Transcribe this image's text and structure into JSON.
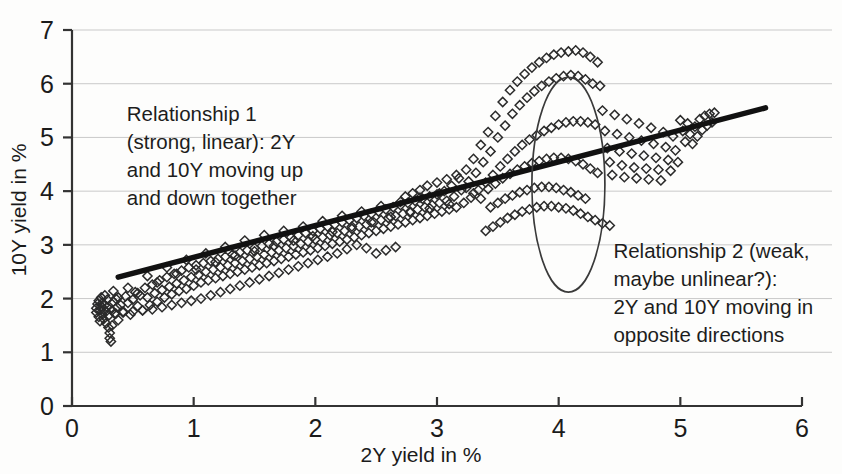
{
  "chart_data": {
    "type": "scatter",
    "title": "",
    "xlabel": "2Y yield in %",
    "ylabel": "10Y yield in %",
    "xlim": [
      0,
      6
    ],
    "ylim": [
      0,
      7
    ],
    "xticks": [
      "0",
      "1",
      "2",
      "3",
      "4",
      "5",
      "6"
    ],
    "yticks": [
      "0",
      "1",
      "2",
      "3",
      "4",
      "5",
      "6",
      "7"
    ],
    "grid": "horizontal",
    "legend": "none",
    "marker": "open-diamond",
    "marker_color": "#2b2b2b",
    "trendline": {
      "label": "linear trend",
      "color": "#111111",
      "x_start": 0.38,
      "y_start": 2.4,
      "x_end": 5.7,
      "y_end": 5.55
    },
    "highlight_ellipse": {
      "label": "relationship-2-cluster",
      "center_x": 4.08,
      "center_y": 4.12,
      "radius_x": 0.3,
      "radius_y": 2.0,
      "color": "#3a3a3a"
    },
    "annotations": [
      {
        "name": "relationship-1",
        "x": 0.45,
        "y": 5.3,
        "lines": [
          "Relationship 1",
          "(strong, linear): 2Y",
          "and 10Y moving up",
          "and down together"
        ]
      },
      {
        "name": "relationship-2",
        "x": 4.45,
        "y": 2.75,
        "lines": [
          "Relationship 2 (weak,",
          "maybe unlinear?):",
          "2Y and 10Y moving in",
          "opposite directions"
        ]
      }
    ],
    "points": [
      [
        0.2,
        1.82
      ],
      [
        0.2,
        1.74
      ],
      [
        0.21,
        1.9
      ],
      [
        0.22,
        1.66
      ],
      [
        0.22,
        1.96
      ],
      [
        0.23,
        1.78
      ],
      [
        0.23,
        1.58
      ],
      [
        0.24,
        1.86
      ],
      [
        0.24,
        2.02
      ],
      [
        0.25,
        1.7
      ],
      [
        0.25,
        1.92
      ],
      [
        0.26,
        1.8
      ],
      [
        0.26,
        1.62
      ],
      [
        0.27,
        1.88
      ],
      [
        0.27,
        2.06
      ],
      [
        0.28,
        1.76
      ],
      [
        0.28,
        1.54
      ],
      [
        0.29,
        1.84
      ],
      [
        0.29,
        1.98
      ],
      [
        0.3,
        1.68
      ],
      [
        0.3,
        1.46
      ],
      [
        0.31,
        1.36
      ],
      [
        0.31,
        1.26
      ],
      [
        0.32,
        1.2
      ],
      [
        0.33,
        1.5
      ],
      [
        0.33,
        1.78
      ],
      [
        0.34,
        1.94
      ],
      [
        0.35,
        1.72
      ],
      [
        0.36,
        2.0
      ],
      [
        0.37,
        1.84
      ],
      [
        0.38,
        1.6
      ],
      [
        0.4,
        1.88
      ],
      [
        0.42,
        1.76
      ],
      [
        0.44,
        2.04
      ],
      [
        0.46,
        1.92
      ],
      [
        0.48,
        1.7
      ],
      [
        0.5,
        1.98
      ],
      [
        0.52,
        2.12
      ],
      [
        0.54,
        1.86
      ],
      [
        0.56,
        2.06
      ],
      [
        0.58,
        1.78
      ],
      [
        0.6,
        2.2
      ],
      [
        0.62,
        2.02
      ],
      [
        0.64,
        1.88
      ],
      [
        0.66,
        2.26
      ],
      [
        0.68,
        2.1
      ],
      [
        0.7,
        1.94
      ],
      [
        0.72,
        2.34
      ],
      [
        0.74,
        2.16
      ],
      [
        0.76,
        2.02
      ],
      [
        0.78,
        2.4
      ],
      [
        0.8,
        2.22
      ],
      [
        0.82,
        2.08
      ],
      [
        0.84,
        2.46
      ],
      [
        0.86,
        2.28
      ],
      [
        0.88,
        2.14
      ],
      [
        0.9,
        2.52
      ],
      [
        0.92,
        2.34
      ],
      [
        0.94,
        2.18
      ],
      [
        0.96,
        2.58
      ],
      [
        0.98,
        2.4
      ],
      [
        1.0,
        2.24
      ],
      [
        1.02,
        2.62
      ],
      [
        1.04,
        2.44
      ],
      [
        1.06,
        2.3
      ],
      [
        1.08,
        2.66
      ],
      [
        1.1,
        2.5
      ],
      [
        1.12,
        2.34
      ],
      [
        1.14,
        2.7
      ],
      [
        1.16,
        2.54
      ],
      [
        1.18,
        2.38
      ],
      [
        1.2,
        2.74
      ],
      [
        1.22,
        2.58
      ],
      [
        1.24,
        2.42
      ],
      [
        1.26,
        2.78
      ],
      [
        1.28,
        2.62
      ],
      [
        1.3,
        2.46
      ],
      [
        1.32,
        2.82
      ],
      [
        1.34,
        2.66
      ],
      [
        1.36,
        2.5
      ],
      [
        1.38,
        2.86
      ],
      [
        1.4,
        2.7
      ],
      [
        1.42,
        2.54
      ],
      [
        1.44,
        2.9
      ],
      [
        1.46,
        2.74
      ],
      [
        1.48,
        2.58
      ],
      [
        1.5,
        2.94
      ],
      [
        1.52,
        2.78
      ],
      [
        1.54,
        2.62
      ],
      [
        1.56,
        2.98
      ],
      [
        1.58,
        2.82
      ],
      [
        1.6,
        2.66
      ],
      [
        1.62,
        3.02
      ],
      [
        1.64,
        2.86
      ],
      [
        1.66,
        2.7
      ],
      [
        1.68,
        3.06
      ],
      [
        1.7,
        2.9
      ],
      [
        1.72,
        2.74
      ],
      [
        1.74,
        3.1
      ],
      [
        1.76,
        2.94
      ],
      [
        1.78,
        2.78
      ],
      [
        1.8,
        3.14
      ],
      [
        1.82,
        2.98
      ],
      [
        1.84,
        2.82
      ],
      [
        1.86,
        3.18
      ],
      [
        1.88,
        3.02
      ],
      [
        1.9,
        2.86
      ],
      [
        1.92,
        3.22
      ],
      [
        1.94,
        3.06
      ],
      [
        1.96,
        2.9
      ],
      [
        1.98,
        3.26
      ],
      [
        2.0,
        3.1
      ],
      [
        2.02,
        2.94
      ],
      [
        2.04,
        3.3
      ],
      [
        2.06,
        3.14
      ],
      [
        2.08,
        2.98
      ],
      [
        2.1,
        3.34
      ],
      [
        2.12,
        3.18
      ],
      [
        2.14,
        3.02
      ],
      [
        2.16,
        3.38
      ],
      [
        2.18,
        3.22
      ],
      [
        2.2,
        3.06
      ],
      [
        2.22,
        3.42
      ],
      [
        2.24,
        3.26
      ],
      [
        2.26,
        3.1
      ],
      [
        2.28,
        3.46
      ],
      [
        2.3,
        3.3
      ],
      [
        2.32,
        3.14
      ],
      [
        2.34,
        3.5
      ],
      [
        2.36,
        3.34
      ],
      [
        2.38,
        3.18
      ],
      [
        2.4,
        3.54
      ],
      [
        2.42,
        3.38
      ],
      [
        2.44,
        3.22
      ],
      [
        2.46,
        3.58
      ],
      [
        2.48,
        3.42
      ],
      [
        2.5,
        3.26
      ],
      [
        2.52,
        3.62
      ],
      [
        2.54,
        3.46
      ],
      [
        2.56,
        3.3
      ],
      [
        2.58,
        3.66
      ],
      [
        2.6,
        3.5
      ],
      [
        2.62,
        3.34
      ],
      [
        2.64,
        3.7
      ],
      [
        2.66,
        3.54
      ],
      [
        2.68,
        3.38
      ],
      [
        2.7,
        3.74
      ],
      [
        2.72,
        3.58
      ],
      [
        2.74,
        3.42
      ],
      [
        2.76,
        3.78
      ],
      [
        2.78,
        3.62
      ],
      [
        2.8,
        3.46
      ],
      [
        2.82,
        3.82
      ],
      [
        2.84,
        3.66
      ],
      [
        2.86,
        3.5
      ],
      [
        2.88,
        3.86
      ],
      [
        2.9,
        3.7
      ],
      [
        2.92,
        3.54
      ],
      [
        2.94,
        3.9
      ],
      [
        2.96,
        3.74
      ],
      [
        2.98,
        3.58
      ],
      [
        3.0,
        3.94
      ],
      [
        3.02,
        3.78
      ],
      [
        3.04,
        3.62
      ],
      [
        3.06,
        4.0
      ],
      [
        3.08,
        3.82
      ],
      [
        3.1,
        3.66
      ],
      [
        3.12,
        4.1
      ],
      [
        3.14,
        3.9
      ],
      [
        3.16,
        3.7
      ],
      [
        3.18,
        4.24
      ],
      [
        3.2,
        4.02
      ],
      [
        3.22,
        3.78
      ],
      [
        3.24,
        4.4
      ],
      [
        3.26,
        4.18
      ],
      [
        3.28,
        3.88
      ],
      [
        3.3,
        4.6
      ],
      [
        3.32,
        4.34
      ],
      [
        3.34,
        4.02
      ],
      [
        3.36,
        4.86
      ],
      [
        3.38,
        4.54
      ],
      [
        3.4,
        4.16
      ],
      [
        3.42,
        5.1
      ],
      [
        3.44,
        4.74
      ],
      [
        3.46,
        4.3
      ],
      [
        3.48,
        5.4
      ],
      [
        3.5,
        5.0
      ],
      [
        3.52,
        4.46
      ],
      [
        3.54,
        5.66
      ],
      [
        3.56,
        5.22
      ],
      [
        3.58,
        4.6
      ],
      [
        3.6,
        5.88
      ],
      [
        3.62,
        5.44
      ],
      [
        3.64,
        4.74
      ],
      [
        3.66,
        6.04
      ],
      [
        3.68,
        5.6
      ],
      [
        3.7,
        4.86
      ],
      [
        3.72,
        6.18
      ],
      [
        3.74,
        5.74
      ],
      [
        3.76,
        4.96
      ],
      [
        3.78,
        6.3
      ],
      [
        3.8,
        5.86
      ],
      [
        3.82,
        5.04
      ],
      [
        3.84,
        6.4
      ],
      [
        3.86,
        5.96
      ],
      [
        3.88,
        5.12
      ],
      [
        3.9,
        6.48
      ],
      [
        3.92,
        6.04
      ],
      [
        3.94,
        5.18
      ],
      [
        3.96,
        6.54
      ],
      [
        3.98,
        6.1
      ],
      [
        4.0,
        5.24
      ],
      [
        4.02,
        6.58
      ],
      [
        4.04,
        6.14
      ],
      [
        4.06,
        5.28
      ],
      [
        4.08,
        6.6
      ],
      [
        4.1,
        6.16
      ],
      [
        4.12,
        5.3
      ],
      [
        4.14,
        6.62
      ],
      [
        4.16,
        6.14
      ],
      [
        4.18,
        5.3
      ],
      [
        4.2,
        6.58
      ],
      [
        4.22,
        6.08
      ],
      [
        4.24,
        5.28
      ],
      [
        4.26,
        6.5
      ],
      [
        4.28,
        6.0
      ],
      [
        4.3,
        5.24
      ],
      [
        4.32,
        6.4
      ],
      [
        3.42,
        4.04
      ],
      [
        3.48,
        4.14
      ],
      [
        3.54,
        4.24
      ],
      [
        3.6,
        4.32
      ],
      [
        3.66,
        4.4
      ],
      [
        3.72,
        4.46
      ],
      [
        3.78,
        4.52
      ],
      [
        3.84,
        4.56
      ],
      [
        3.9,
        4.6
      ],
      [
        3.96,
        4.62
      ],
      [
        4.02,
        4.62
      ],
      [
        4.08,
        4.6
      ],
      [
        4.14,
        4.56
      ],
      [
        4.2,
        4.5
      ],
      [
        4.26,
        4.42
      ],
      [
        4.32,
        4.34
      ],
      [
        3.44,
        3.7
      ],
      [
        3.5,
        3.78
      ],
      [
        3.56,
        3.86
      ],
      [
        3.62,
        3.92
      ],
      [
        3.68,
        3.98
      ],
      [
        3.74,
        4.02
      ],
      [
        3.8,
        4.06
      ],
      [
        3.86,
        4.08
      ],
      [
        3.92,
        4.08
      ],
      [
        3.98,
        4.06
      ],
      [
        4.04,
        4.02
      ],
      [
        4.1,
        3.98
      ],
      [
        4.16,
        3.92
      ],
      [
        4.22,
        3.86
      ],
      [
        3.4,
        3.26
      ],
      [
        3.46,
        3.34
      ],
      [
        3.52,
        3.42
      ],
      [
        3.58,
        3.5
      ],
      [
        3.64,
        3.56
      ],
      [
        3.7,
        3.62
      ],
      [
        3.76,
        3.66
      ],
      [
        3.82,
        3.7
      ],
      [
        3.88,
        3.72
      ],
      [
        3.94,
        3.72
      ],
      [
        4.0,
        3.7
      ],
      [
        4.06,
        3.68
      ],
      [
        4.12,
        3.64
      ],
      [
        4.18,
        3.58
      ],
      [
        4.24,
        3.52
      ],
      [
        4.3,
        3.46
      ],
      [
        4.36,
        3.4
      ],
      [
        4.42,
        3.36
      ],
      [
        4.34,
        5.96
      ],
      [
        4.36,
        5.5
      ],
      [
        4.38,
        5.12
      ],
      [
        4.4,
        4.8
      ],
      [
        4.42,
        4.54
      ],
      [
        4.44,
        4.3
      ],
      [
        4.46,
        5.42
      ],
      [
        4.48,
        5.06
      ],
      [
        4.5,
        4.74
      ],
      [
        4.52,
        4.48
      ],
      [
        4.54,
        4.26
      ],
      [
        4.56,
        5.34
      ],
      [
        4.58,
        5.0
      ],
      [
        4.6,
        4.7
      ],
      [
        4.62,
        4.44
      ],
      [
        4.64,
        4.24
      ],
      [
        4.66,
        5.26
      ],
      [
        4.68,
        4.94
      ],
      [
        4.7,
        4.66
      ],
      [
        4.72,
        4.42
      ],
      [
        4.74,
        4.22
      ],
      [
        4.76,
        5.18
      ],
      [
        4.78,
        4.88
      ],
      [
        4.8,
        4.62
      ],
      [
        4.82,
        4.4
      ],
      [
        4.84,
        4.2
      ],
      [
        4.86,
        5.1
      ],
      [
        4.88,
        4.82
      ],
      [
        4.9,
        4.58
      ],
      [
        4.92,
        4.38
      ],
      [
        4.94,
        5.02
      ],
      [
        4.96,
        4.76
      ],
      [
        4.98,
        4.54
      ],
      [
        5.0,
        5.32
      ],
      [
        5.02,
        5.12
      ],
      [
        5.04,
        4.92
      ],
      [
        5.06,
        5.26
      ],
      [
        5.08,
        5.06
      ],
      [
        5.1,
        4.88
      ],
      [
        5.12,
        5.2
      ],
      [
        5.14,
        5.02
      ],
      [
        5.16,
        5.34
      ],
      [
        5.18,
        5.14
      ],
      [
        5.2,
        5.4
      ],
      [
        5.22,
        5.22
      ],
      [
        5.24,
        5.44
      ],
      [
        5.26,
        5.28
      ],
      [
        5.28,
        5.46
      ],
      [
        0.62,
        2.42
      ],
      [
        0.7,
        2.3
      ],
      [
        0.78,
        2.58
      ],
      [
        0.86,
        2.46
      ],
      [
        0.94,
        2.72
      ],
      [
        1.02,
        2.54
      ],
      [
        1.1,
        2.84
      ],
      [
        1.18,
        2.68
      ],
      [
        1.26,
        2.96
      ],
      [
        1.34,
        2.8
      ],
      [
        1.42,
        3.08
      ],
      [
        1.5,
        2.88
      ],
      [
        1.58,
        3.18
      ],
      [
        1.66,
        2.98
      ],
      [
        1.74,
        3.26
      ],
      [
        1.82,
        3.08
      ],
      [
        1.9,
        3.34
      ],
      [
        1.98,
        3.16
      ],
      [
        2.06,
        3.44
      ],
      [
        2.14,
        3.24
      ],
      [
        2.22,
        3.54
      ],
      [
        2.3,
        3.34
      ],
      [
        2.38,
        3.62
      ],
      [
        2.46,
        3.42
      ],
      [
        2.54,
        3.72
      ],
      [
        2.62,
        3.52
      ],
      [
        2.7,
        3.8
      ],
      [
        2.78,
        3.6
      ],
      [
        2.86,
        3.88
      ],
      [
        2.94,
        3.68
      ],
      [
        3.02,
        3.96
      ],
      [
        3.1,
        3.76
      ],
      [
        0.46,
        2.2
      ],
      [
        0.54,
        2.1
      ],
      [
        0.38,
        2.02
      ],
      [
        0.34,
        2.14
      ],
      [
        2.92,
        4.1
      ],
      [
        3.0,
        4.16
      ],
      [
        3.08,
        4.22
      ],
      [
        2.86,
        4.02
      ],
      [
        2.8,
        3.96
      ],
      [
        2.74,
        3.9
      ],
      [
        3.16,
        4.3
      ],
      [
        3.24,
        4.06
      ],
      [
        3.3,
        3.96
      ],
      [
        3.36,
        3.86
      ],
      [
        2.66,
        2.96
      ],
      [
        2.58,
        2.9
      ],
      [
        2.5,
        2.84
      ],
      [
        2.42,
        2.94
      ],
      [
        2.34,
        3.0
      ],
      [
        2.26,
        2.92
      ],
      [
        2.18,
        2.84
      ],
      [
        2.1,
        2.78
      ],
      [
        2.02,
        2.72
      ],
      [
        1.94,
        2.66
      ],
      [
        1.86,
        2.6
      ],
      [
        1.78,
        2.54
      ],
      [
        1.7,
        2.48
      ],
      [
        1.62,
        2.42
      ],
      [
        1.54,
        2.36
      ],
      [
        1.46,
        2.3
      ],
      [
        1.38,
        2.24
      ],
      [
        1.3,
        2.18
      ],
      [
        1.22,
        2.12
      ],
      [
        1.14,
        2.06
      ],
      [
        1.06,
        2.0
      ],
      [
        0.98,
        1.96
      ],
      [
        0.9,
        1.92
      ],
      [
        0.82,
        1.88
      ],
      [
        0.74,
        1.84
      ],
      [
        0.66,
        1.8
      ],
      [
        0.58,
        1.78
      ],
      [
        0.5,
        1.76
      ],
      [
        0.42,
        1.74
      ],
      [
        0.36,
        1.72
      ]
    ]
  }
}
